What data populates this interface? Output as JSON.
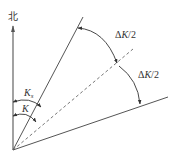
{
  "diagram": {
    "north_label": "北",
    "labels": {
      "delta_top": {
        "prefix": "Δ",
        "var": "K",
        "suffix": "/2"
      },
      "delta_bottom": {
        "prefix": "Δ",
        "var": "K",
        "suffix": "/2"
      },
      "ks": {
        "var": "K",
        "sub": "s"
      },
      "k": {
        "var": "K"
      }
    },
    "colors": {
      "line": "#555555",
      "dashed": "#777777",
      "text": "#333333"
    },
    "elements": [
      "north-axis-arrow",
      "upper-bound-line",
      "dashed-bisector-line",
      "lower-bound-line",
      "arc-delta-top",
      "arc-delta-bottom",
      "arc-ks",
      "arc-k"
    ]
  }
}
